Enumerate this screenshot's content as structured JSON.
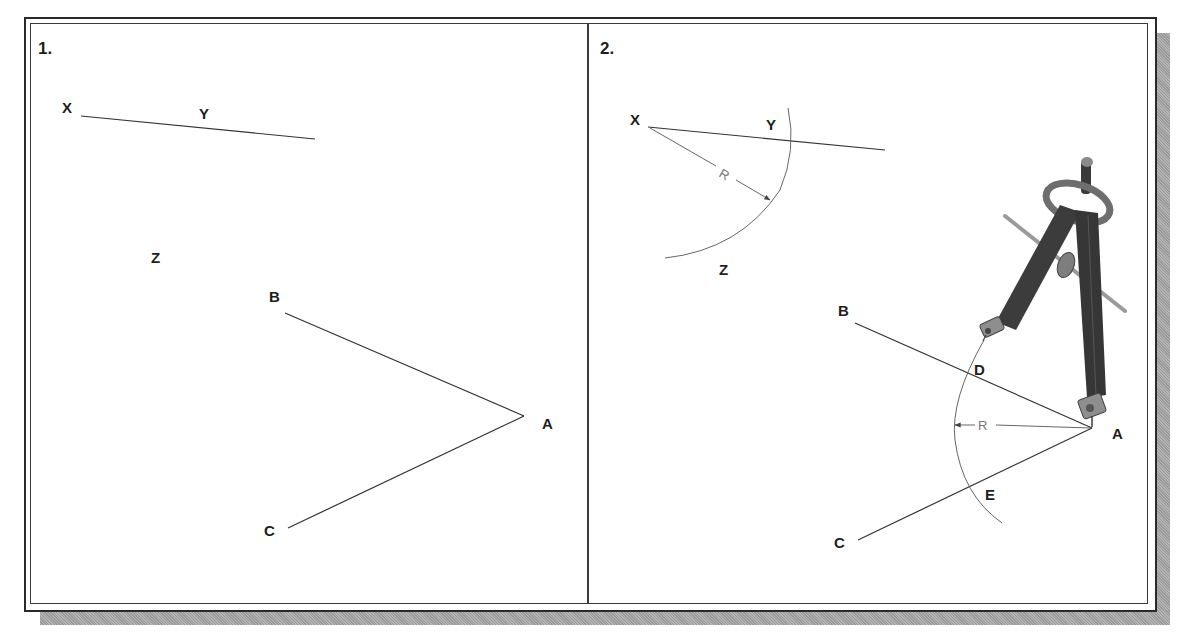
{
  "figure": {
    "panels": [
      {
        "number": "1.",
        "points": {
          "X": "X",
          "Y": "Y",
          "Z": "Z",
          "A": "A",
          "B": "B",
          "C": "C"
        }
      },
      {
        "number": "2.",
        "points": {
          "X": "X",
          "Y": "Y",
          "Z": "Z",
          "A": "A",
          "B": "B",
          "C": "C",
          "D": "D",
          "E": "E"
        },
        "dimension_labels": {
          "radius_1": "R",
          "radius_2": "R"
        },
        "illustration": "compass-icon"
      }
    ]
  },
  "colors": {
    "line": "#333333",
    "label": "#1e1e1e",
    "dimension": "#777777",
    "shadow": "#a8a8a8",
    "compass_body": "#3c3c3c",
    "compass_highlight": "#9a9a9a"
  }
}
